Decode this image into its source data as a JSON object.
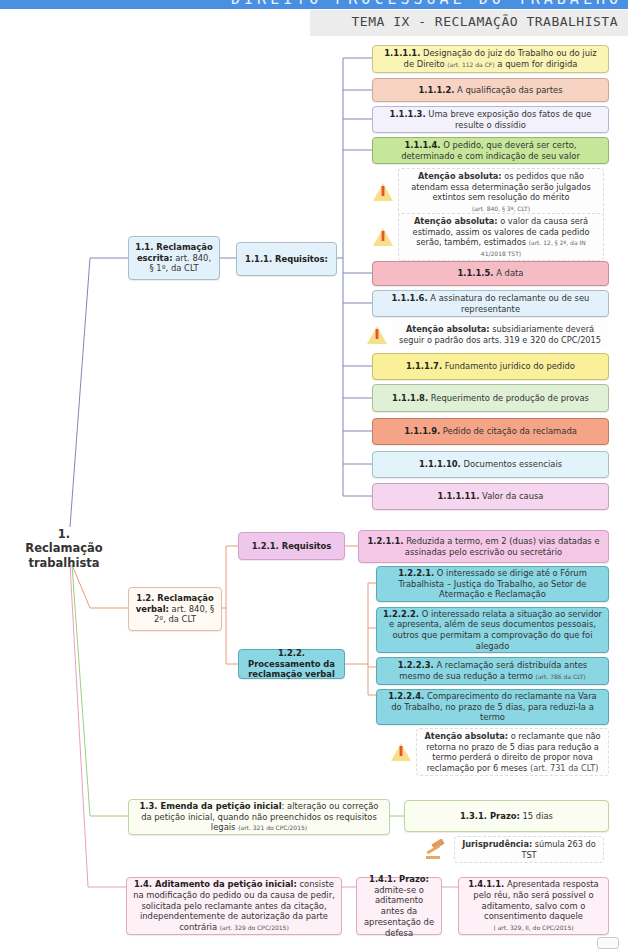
{
  "header": {
    "subject": "DIREITO PROCESSUAL DO TRABALHO",
    "theme": "TEMA IX - RECLAMAÇÃO TRABALHISTA"
  },
  "colors": {
    "header_bar": "#4a90e2",
    "branch_1_1": "#7f86b8",
    "branch_1_2": "#e89a7a",
    "branch_1_3": "#9ccf7a",
    "branch_1_4": "#e6a0bc"
  },
  "root": {
    "label": "1. Reclamação trabalhista"
  },
  "n1_1": {
    "num": "1.1. Reclamação escrita:",
    "text": " art. 840, § 1º, da CLT"
  },
  "n1_1_1": {
    "label": "1.1.1. Requisitos:"
  },
  "req": [
    {
      "num": "1.1.1.1.",
      "text": " Designação do juiz do Trabalho ou do juiz de Direito ",
      "ref": "(art. 112 da CF)",
      "tail": " a quem for dirigida",
      "bg": "#fbf5b5",
      "border": "#c9c28a"
    },
    {
      "num": "1.1.1.2.",
      "text": " A qualificação das partes",
      "bg": "#f6d3c3",
      "border": "#cfa898"
    },
    {
      "num": "1.1.1.3.",
      "text": " Uma breve exposição dos fatos de que resulte o dissídio",
      "bg": "#f3f1fb",
      "border": "#b8b5cf"
    },
    {
      "num": "1.1.1.4.",
      "text": " O pedido, que deverá ser certo, determinado e com indicação de seu valor",
      "bg": "#c6e79a",
      "border": "#97b66d"
    },
    {
      "num": "1.1.1.5.",
      "text": " A data",
      "bg": "#f6bcc6",
      "border": "#c98c98"
    },
    {
      "num": "1.1.1.6.",
      "text": " A assinatura do reclamante ou de seu representante",
      "bg": "#e3f1fa",
      "border": "#a9bccb"
    },
    {
      "num": "1.1.1.7.",
      "text": " Fundamento jurídico do pedido",
      "bg": "#fbf09a",
      "border": "#c9bd6e"
    },
    {
      "num": "1.1.1.8.",
      "text": " Requerimento de produção de provas",
      "bg": "#dff0d6",
      "border": "#a8c19b"
    },
    {
      "num": "1.1.1.9.",
      "text": " Pedido de citação da reclamada",
      "bg": "#f6a488",
      "border": "#c47c64"
    },
    {
      "num": "1.1.1.10.",
      "text": " Documentos essenciais",
      "bg": "#e2f3fa",
      "border": "#a7bfca"
    },
    {
      "num": "1.1.1.11.",
      "text": " Valor da causa",
      "bg": "#f6d6ee",
      "border": "#c6a3bd"
    }
  ],
  "warnings": [
    {
      "title": "Atenção absoluta:",
      "text": " os pedidos que não atendam essa determinação serão julgados extintos sem resolução do mérito",
      "ref": "(art. 840, § 3º, CLT)"
    },
    {
      "title": "Atenção absoluta:",
      "text": " o valor da causa será estimado, assim os valores de cada pedido serão, também, estimados ",
      "ref": "(art. 12, § 2º, da IN 41/2018 TST)"
    },
    {
      "title": "Atenção absoluta:",
      "text": " subsidiariamente deverá seguir o padrão dos arts. 319 e 320 do CPC/2015"
    },
    {
      "title": "Atenção absoluta:",
      "text": " o reclamante que não retorna no prazo de 5 dias para redução a termo perderá o direito de propor nova reclamação por 6 meses ",
      "ref": "(art. 731 da CLT)"
    }
  ],
  "n1_2": {
    "num": "1.2. Reclamação verbal:",
    "text": " art. 840, § 2º, da CLT"
  },
  "n1_2_1": {
    "label": "1.2.1. Requisitos"
  },
  "n1_2_1_1": {
    "num": "1.2.1.1.",
    "text": " Reduzida a termo, em 2 (duas) vias datadas e assinadas pelo escrivão ou secretário"
  },
  "n1_2_2": {
    "label": "1.2.2. Processamento da reclamação verbal"
  },
  "proc": [
    {
      "num": "1.2.2.1.",
      "text": " O interessado se dirige até o Fórum Trabalhista – Justiça do Trabalho, ao Setor de Atermação e Reclamação"
    },
    {
      "num": "1.2.2.2.",
      "text": " O interessado relata a situação ao servidor e apresenta, além de seus documentos pessoais, outros que permitam a comprovação do que foi alegado"
    },
    {
      "num": "1.2.2.3.",
      "text": " A reclamação será distribuída antes mesmo de sua redução a termo ",
      "ref": "(art. 786 da CLT)"
    },
    {
      "num": "1.2.2.4.",
      "text": " Comparecimento do reclamante na Vara do Trabalho, no prazo de 5 dias, para reduzi-la a termo"
    }
  ],
  "n1_3": {
    "num": "1.3. Emenda da petição inicial",
    "text": ": alteração ou correção da petição inicial, quando não preenchidos os requisitos legais ",
    "ref": "(art. 321 do CPC/2015)"
  },
  "n1_3_1": {
    "num": "1.3.1. Prazo:",
    "text": " 15 dias"
  },
  "jurisprudencia": {
    "title": "Jurisprudência:",
    "text": " súmula 263 do TST"
  },
  "n1_4": {
    "num": "1.4. Aditamento da petição inicial:",
    "text": " consiste na modificação do pedido ou da causa de pedir, solicitada pelo reclamante antes da citação, independentemente de autorização da parte contrária ",
    "ref": "(art. 329 do CPC/2015)"
  },
  "n1_4_1": {
    "num": "1.4.1. Prazo:",
    "text": " admite-se o aditamento antes da apresentação de defesa"
  },
  "n1_4_1_1": {
    "num": "1.4.1.1.",
    "text": " Apresentada resposta pelo réu, não será possível o aditamento, salvo com o consentimento daquele",
    "ref": "( art. 329, II, do CPC/2015)"
  }
}
